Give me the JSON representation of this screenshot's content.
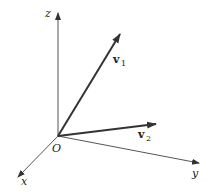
{
  "diagram": {
    "type": "3d-coordinate-axes-with-vectors",
    "origin": {
      "label": "O",
      "x": 58,
      "y": 136
    },
    "axes": [
      {
        "name": "z",
        "label": "z",
        "tip": {
          "x": 58,
          "y": 12
        }
      },
      {
        "name": "x",
        "label": "x",
        "tip": {
          "x": 17,
          "y": 178
        }
      },
      {
        "name": "y",
        "label": "y",
        "tip": {
          "x": 200,
          "y": 163
        }
      }
    ],
    "vectors": [
      {
        "name": "v1",
        "label": "v",
        "subscript": "1",
        "tip": {
          "x": 120,
          "y": 33
        }
      },
      {
        "name": "v2",
        "label": "v",
        "subscript": "2",
        "tip": {
          "x": 157,
          "y": 124
        }
      }
    ],
    "colors": {
      "axis": "#555555",
      "vector": "#333333",
      "text": "#222222"
    }
  }
}
